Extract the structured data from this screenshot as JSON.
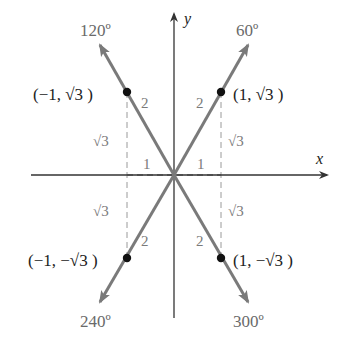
{
  "figure": {
    "axes": {
      "x_label": "x",
      "y_label": "y"
    },
    "angles": [
      {
        "label": "120º",
        "degrees": 120
      },
      {
        "label": "60º",
        "degrees": 60
      },
      {
        "label": "240º",
        "degrees": 240
      },
      {
        "label": "300º",
        "degrees": 300
      }
    ],
    "points": [
      {
        "label": "(−1, √3 )",
        "x": -1,
        "y": "√3"
      },
      {
        "label": "(1, √3 )",
        "x": 1,
        "y": "√3"
      },
      {
        "label": "(−1, −√3 )",
        "x": -1,
        "y": "−√3"
      },
      {
        "label": "(1, −√3 )",
        "x": 1,
        "y": "−√3"
      }
    ],
    "hypotenuse_label": "2",
    "vertical_leg_label": "√3",
    "horizontal_leg_label": "1",
    "colors": {
      "ray": "#7a7a7a",
      "axis": "#333333",
      "point": "#111111",
      "label_gray": "#6a6a6a"
    }
  }
}
